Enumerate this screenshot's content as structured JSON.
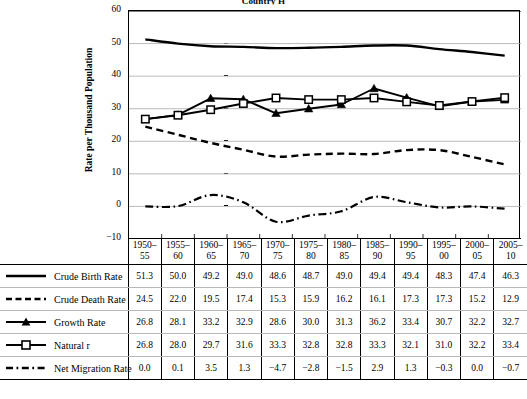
{
  "chart_title": "Country H",
  "y_axis_title": "Rate per Thousand Population",
  "y_ticks": [
    "60",
    "50",
    "40",
    "30",
    "20",
    "10",
    "0",
    "-10"
  ],
  "table": {
    "corner_label": "",
    "period_headers": [
      {
        "top": "1950–",
        "bottom": "55"
      },
      {
        "top": "1955–",
        "bottom": "60"
      },
      {
        "top": "1960–",
        "bottom": "65"
      },
      {
        "top": "1965–",
        "bottom": "70"
      },
      {
        "top": "1970–",
        "bottom": "75"
      },
      {
        "top": "1975–",
        "bottom": "80"
      },
      {
        "top": "1980–",
        "bottom": "85"
      },
      {
        "top": "1985–",
        "bottom": "90"
      },
      {
        "top": "1990–",
        "bottom": "95"
      },
      {
        "top": "1995–",
        "bottom": "00"
      },
      {
        "top": "2000–",
        "bottom": "05"
      },
      {
        "top": "2005–",
        "bottom": "10"
      }
    ],
    "rows": [
      {
        "label": "Crude Birth Rate",
        "style": "solid",
        "values": [
          "51.3",
          "50.0",
          "49.2",
          "49.0",
          "48.6",
          "48.7",
          "49.0",
          "49.4",
          "49.4",
          "48.3",
          "47.4",
          "46.3"
        ]
      },
      {
        "label": "Crude Death Rate",
        "style": "dashed",
        "values": [
          "24.5",
          "22.0",
          "19.5",
          "17.4",
          "15.3",
          "15.9",
          "16.2",
          "16.1",
          "17.3",
          "17.3",
          "15.2",
          "12.9"
        ]
      },
      {
        "label": "Growth Rate",
        "style": "triangle",
        "values": [
          "26.8",
          "28.1",
          "33.2",
          "32.9",
          "28.6",
          "30.0",
          "31.3",
          "36.2",
          "33.4",
          "30.7",
          "32.2",
          "32.7"
        ]
      },
      {
        "label": "Natural r",
        "style": "square",
        "values": [
          "26.8",
          "28.0",
          "29.7",
          "31.6",
          "33.3",
          "32.8",
          "32.8",
          "33.3",
          "32.1",
          "31.0",
          "32.2",
          "33.4"
        ]
      },
      {
        "label": "Net Migration Rate",
        "style": "dashdot",
        "values": [
          "0.0",
          "0.1",
          "3.5",
          "1.3",
          "−4.7",
          "−2.8",
          "−1.5",
          "2.9",
          "1.3",
          "−0.3",
          "0.0",
          "−0.7"
        ]
      }
    ]
  },
  "chart_data": {
    "type": "line",
    "title": "Country H",
    "xlabel": "",
    "ylabel": "Rate per Thousand Population",
    "ylim": [
      -10,
      60
    ],
    "yticks": [
      -10,
      0,
      10,
      20,
      30,
      40,
      50,
      60
    ],
    "grid": true,
    "legend_position": "table-below",
    "categories": [
      "1950–55",
      "1955–60",
      "1960–65",
      "1965–70",
      "1970–75",
      "1975–80",
      "1980–85",
      "1985–90",
      "1990–95",
      "1995–00",
      "2000–05",
      "2005–10"
    ],
    "series": [
      {
        "name": "Crude Birth Rate",
        "marker": "none",
        "linestyle": "solid",
        "color": "#000000",
        "values": [
          51.3,
          50.0,
          49.2,
          49.0,
          48.6,
          48.7,
          49.0,
          49.4,
          49.4,
          48.3,
          47.4,
          46.3
        ]
      },
      {
        "name": "Crude Death Rate",
        "marker": "none",
        "linestyle": "dashed",
        "color": "#000000",
        "values": [
          24.5,
          22.0,
          19.5,
          17.4,
          15.3,
          15.9,
          16.2,
          16.1,
          17.3,
          17.3,
          15.2,
          12.9
        ]
      },
      {
        "name": "Growth Rate",
        "marker": "filled-triangle",
        "linestyle": "solid",
        "color": "#000000",
        "values": [
          26.8,
          28.1,
          33.2,
          32.9,
          28.6,
          30.0,
          31.3,
          36.2,
          33.4,
          30.7,
          32.2,
          32.7
        ]
      },
      {
        "name": "Natural r",
        "marker": "open-square",
        "linestyle": "solid",
        "color": "#000000",
        "values": [
          26.8,
          28.0,
          29.7,
          31.6,
          33.3,
          32.8,
          32.8,
          33.3,
          32.1,
          31.0,
          32.2,
          33.4
        ]
      },
      {
        "name": "Net Migration Rate",
        "marker": "none",
        "linestyle": "dashdot",
        "color": "#000000",
        "values": [
          0.0,
          0.1,
          3.5,
          1.3,
          -4.7,
          -2.8,
          -1.5,
          2.9,
          1.3,
          -0.3,
          0.0,
          -0.7
        ]
      }
    ]
  }
}
